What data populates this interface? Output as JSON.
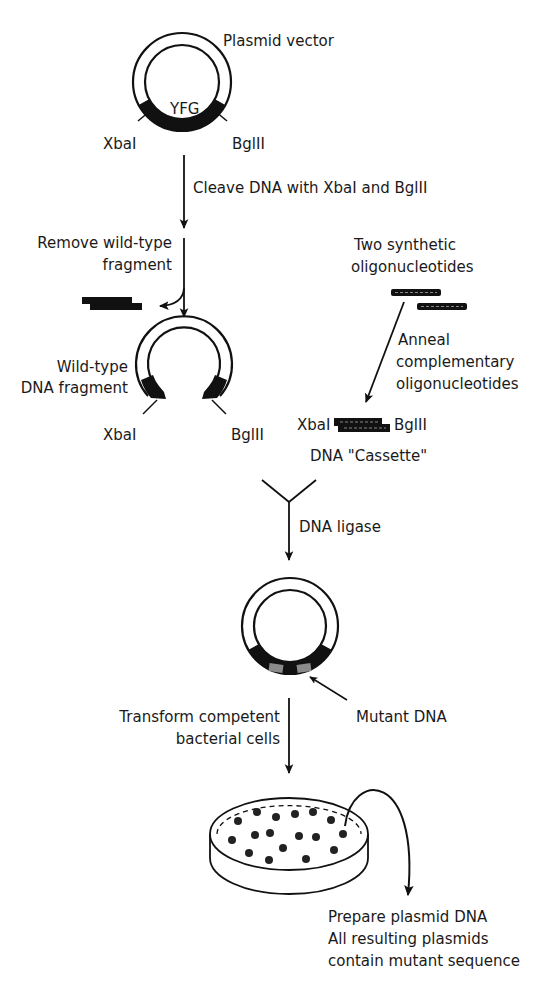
{
  "diagram": {
    "step1": {
      "plasmid_label": "Plasmid vector",
      "gene_label": "YFG",
      "site_left": "XbaI",
      "site_right": "BglII"
    },
    "arrow1_label": "Cleave DNA with XbaI and BglII",
    "remove_label": [
      "Remove wild-type",
      "fragment"
    ],
    "step2": {
      "fragment_label": [
        "Wild-type",
        "DNA fragment"
      ],
      "site_left": "XbaI",
      "site_right": "BglII"
    },
    "oligos": {
      "label": [
        "Two synthetic",
        "oligonucleotides"
      ],
      "anneal_label": [
        "Anneal",
        "complementary",
        "oligonucleotides"
      ],
      "cassette_left": "XbaI",
      "cassette_right": "BglII",
      "cassette_label": "DNA \"Cassette\""
    },
    "ligase_label": "DNA ligase",
    "step3": {
      "mutant_label": "Mutant DNA"
    },
    "transform_label": [
      "Transform competent",
      "bacterial cells"
    ],
    "final_label": [
      "Prepare plasmid DNA",
      "All resulting plasmids",
      "contain mutant sequence"
    ],
    "colors": {
      "ink": "#111111",
      "background": "#ffffff",
      "mutant_fill": "#8a8a8a"
    }
  }
}
